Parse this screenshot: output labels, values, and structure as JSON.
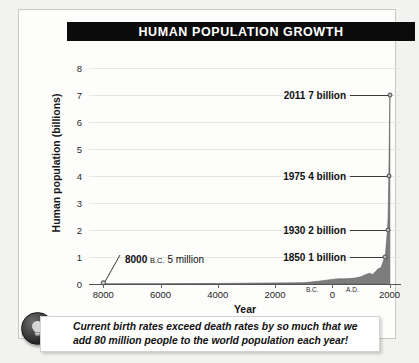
{
  "figure": {
    "title": "HUMAN POPULATION GROWTH",
    "caption": "Current birth rates exceed death rates by so much that we add 80 million people to the world population each year!",
    "bulb_icon": "lightbulb-icon"
  },
  "chart_data": {
    "type": "area",
    "title": "HUMAN POPULATION GROWTH",
    "xlabel": "Year",
    "ylabel": "Human population (billions)",
    "xlim": [
      -8500,
      2400
    ],
    "ylim": [
      0,
      8.5
    ],
    "grid": true,
    "legend": "none",
    "y_ticks": [
      "0",
      "1",
      "2",
      "3",
      "4",
      "5",
      "6",
      "7",
      "8"
    ],
    "y_tick_values": [
      0,
      1,
      2,
      3,
      4,
      5,
      6,
      7,
      8
    ],
    "x_ticks": [
      "8000",
      "6000",
      "4000",
      "2000",
      "0",
      "2000"
    ],
    "x_tick_values": [
      -8000,
      -6000,
      -4000,
      -2000,
      0,
      2000
    ],
    "era_markers": [
      {
        "label": "B.C.",
        "value": -700
      },
      {
        "label": "A.D.",
        "value": 700
      }
    ],
    "series": [
      {
        "name": "World population",
        "x": [
          -8000,
          -7000,
          -6000,
          -5000,
          -4000,
          -3000,
          -2000,
          -1000,
          -500,
          0,
          200,
          400,
          600,
          800,
          1000,
          1200,
          1300,
          1400,
          1500,
          1600,
          1700,
          1800,
          1850,
          1900,
          1930,
          1950,
          1975,
          2000,
          2011
        ],
        "values": [
          0.005,
          0.007,
          0.01,
          0.015,
          0.02,
          0.03,
          0.04,
          0.05,
          0.1,
          0.17,
          0.19,
          0.19,
          0.2,
          0.22,
          0.27,
          0.36,
          0.4,
          0.35,
          0.44,
          0.56,
          0.6,
          0.9,
          1.0,
          1.65,
          2.0,
          2.5,
          4.0,
          6.1,
          7.0
        ]
      }
    ],
    "annotations": [
      {
        "id": "ann-2011",
        "year": "2011",
        "amount": "7 billion",
        "text": "2011 7 billion",
        "x_value": 2011,
        "y_value": 7
      },
      {
        "id": "ann-1975",
        "year": "1975",
        "amount": "4 billion",
        "text": "1975 4 billion",
        "x_value": 1975,
        "y_value": 4
      },
      {
        "id": "ann-1930",
        "year": "1930",
        "amount": "2 billion",
        "text": "1930 2 billion",
        "x_value": 1930,
        "y_value": 2
      },
      {
        "id": "ann-1850",
        "year": "1850",
        "amount": "1 billion",
        "text": "1850 1 billion",
        "x_value": 1850,
        "y_value": 1
      },
      {
        "id": "ann-8000bc",
        "year": "8000",
        "era": "B.C.",
        "amount": "5 million",
        "text": "8000 B.C. 5 million",
        "x_value": -8000,
        "y_value": 0.005
      }
    ],
    "colors": {
      "area_fill": "#7d7d7d",
      "title_bar": "#0b0b0b",
      "gridline": "#e6e6e4",
      "plot_background": "#fdfdfc"
    }
  }
}
